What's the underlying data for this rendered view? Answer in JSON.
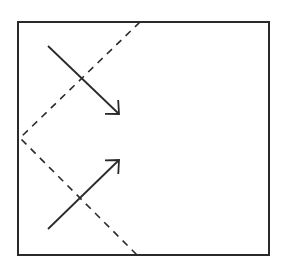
{
  "diagram": {
    "type": "reflection-diagram",
    "background": "#ffffff",
    "stroke_color": "#2a2a2a",
    "frame": {
      "x": 18,
      "y": 22,
      "width": 251,
      "height": 233,
      "stroke_width": 2
    },
    "dashed_path": {
      "points": [
        [
          140,
          22
        ],
        [
          20,
          138
        ],
        [
          138,
          256
        ]
      ],
      "stroke_width": 1.6,
      "dash": "7,6"
    },
    "arrows": [
      {
        "name": "incoming-arrow",
        "from": [
          48,
          46
        ],
        "to": [
          119,
          114
        ],
        "direction": "down-right"
      },
      {
        "name": "outgoing-arrow",
        "from": [
          48,
          229
        ],
        "to": [
          119,
          160
        ],
        "direction": "up-right"
      }
    ]
  }
}
